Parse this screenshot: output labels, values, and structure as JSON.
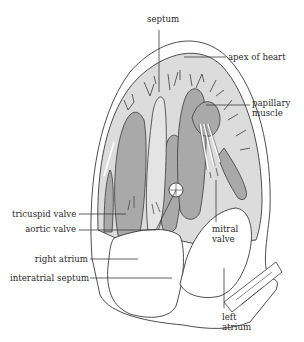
{
  "diagram": {
    "colors": {
      "background": "#ffffff",
      "stroke": "#3a3a3a",
      "muscle_light": "#dcdcdc",
      "muscle_dark": "#a9a9a9",
      "chamber": "#ffffff"
    },
    "labels": {
      "septum": "septum",
      "apex": "apex of heart",
      "papillary_line1": "papillary",
      "papillary_line2": "muscle",
      "tricuspid": "tricuspid valve",
      "aortic": "aortic valve",
      "mitral_line1": "mitral",
      "mitral_line2": "valve",
      "right_atrium": "right atrium",
      "interatrial": "interatrial septum",
      "left_atrium_line1": "left",
      "left_atrium_line2": "atrium"
    }
  }
}
